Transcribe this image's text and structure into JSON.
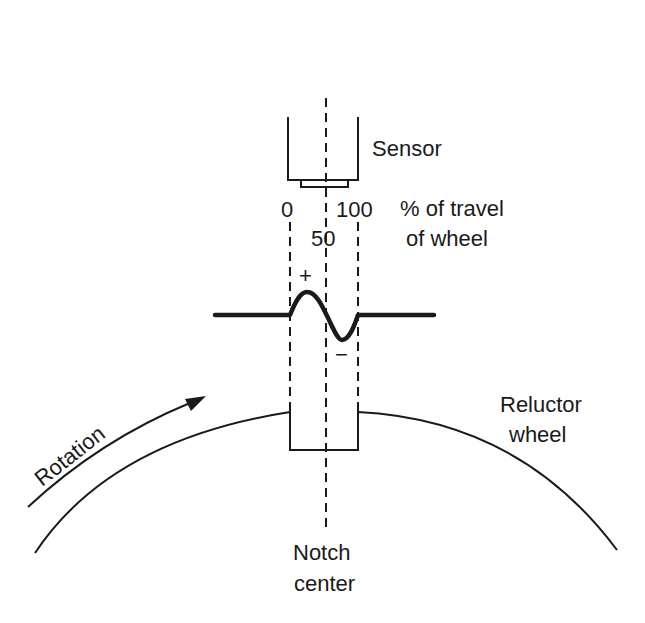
{
  "diagram": {
    "type": "magnetic crankshaft position sensor / reluctor wheel",
    "colors": {
      "line": "#1a1a1a",
      "background": "#ffffff"
    },
    "labels": {
      "sensor": "Sensor",
      "travel_line1": "% of travel",
      "travel_line2": "of wheel",
      "tick_0": "0",
      "tick_50": "50",
      "tick_100": "100",
      "plus": "+",
      "minus": "−",
      "rotation": "Rotation",
      "reluctor_line1": "Reluctor",
      "reluctor_line2": "wheel",
      "notch_line1": "Notch",
      "notch_line2": "center"
    },
    "travel_scale_percent": [
      0,
      50,
      100
    ],
    "waveform": {
      "description": "Sensor output: positive peak between 0–50%, negative trough between 50–100%, flat outside notch",
      "polarity_sequence": [
        "+",
        "−"
      ]
    }
  }
}
